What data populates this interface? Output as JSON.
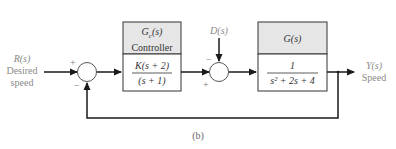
{
  "diagram": {
    "input": {
      "symbol": "R(s)",
      "label_line1": "Desired",
      "label_line2": "speed"
    },
    "disturbance": {
      "symbol": "D(s)"
    },
    "output": {
      "symbol": "Y(s)",
      "label": "Speed"
    },
    "controller": {
      "header_symbol": "Gc(s)",
      "header_main": "G",
      "header_sub": "c",
      "header_arg": "(s)",
      "name": "Controller",
      "numerator": "K(s + 2)",
      "denominator": "(s + 1)"
    },
    "plant": {
      "header_symbol": "G(s)",
      "numerator": "1",
      "denominator": "s² + 2s + 4"
    },
    "summing_junction_1": {
      "plus_sign": "+",
      "minus_sign": "−"
    },
    "summing_junction_2": {
      "plus_sign": "+",
      "minus_sign": "−"
    },
    "caption": "(b)",
    "colors": {
      "line": "#1a1a1a",
      "header_fill": "#e6e6e6",
      "label": "#8a8a8a"
    }
  }
}
